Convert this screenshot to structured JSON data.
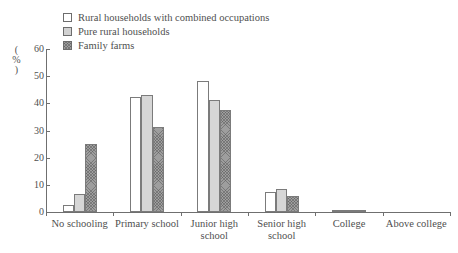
{
  "chart_data": {
    "type": "bar",
    "title": "",
    "xlabel": "",
    "ylabel": "(%)",
    "ylim": [
      0,
      60
    ],
    "yticks": [
      0,
      10,
      20,
      30,
      40,
      50,
      60
    ],
    "grid": false,
    "legend_position": "top-left",
    "categories": [
      "No schooling",
      "Primary school",
      "Junior high school",
      "Senior high school",
      "College",
      "Above college"
    ],
    "series": [
      {
        "name": "Rural households with combined occupations",
        "swatch": "white",
        "values": [
          2.6,
          42.3,
          48.3,
          7.4,
          0.7,
          0
        ]
      },
      {
        "name": "Pure rural households",
        "swatch": "light-dotted",
        "values": [
          6.5,
          43.2,
          41.3,
          8.6,
          0.8,
          0
        ]
      },
      {
        "name": "Family farms",
        "swatch": "dark-hatched",
        "values": [
          25.2,
          31.4,
          37.6,
          5.9,
          0.4,
          0
        ]
      }
    ]
  },
  "legend": {
    "items": [
      {
        "label": "Rural households with combined occupations"
      },
      {
        "label": "Pure rural households"
      },
      {
        "label": "Family farms"
      }
    ]
  },
  "yaxis": {
    "title": "(%)",
    "ticks": [
      "60",
      "50",
      "40",
      "30",
      "20",
      "10",
      "0"
    ]
  },
  "xaxis": {
    "labels": [
      "No schooling",
      "Primary school",
      "Junior high\nschool",
      "Senior high\nschool",
      "College",
      "Above college"
    ]
  },
  "colors": {
    "axis": "#6f6f6f",
    "text": "#4f4f4f",
    "series_white": "#ffffff",
    "series_light": "#d6d6d6",
    "series_dark": "#9e9e9e"
  }
}
